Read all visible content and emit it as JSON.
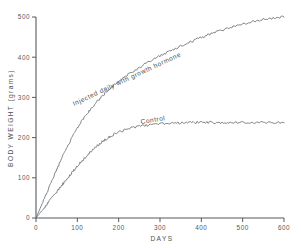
{
  "chart_data": {
    "type": "line",
    "title": "",
    "xlabel": "DAYS",
    "ylabel": "BODY WEIGHT (grams)",
    "xlim": [
      0,
      600
    ],
    "ylim": [
      0,
      500
    ],
    "xticks": [
      0,
      100,
      200,
      300,
      400,
      500,
      600
    ],
    "yticks": [
      0,
      100,
      200,
      300,
      400,
      500
    ],
    "xtick_labels": [
      "0",
      "100",
      "200",
      "300",
      "400",
      "500",
      "600"
    ],
    "ytick_labels": [
      "0",
      "100",
      "200",
      "300",
      "400",
      "500"
    ],
    "grid": false,
    "legend": "inline-annotations",
    "series": [
      {
        "name": "Injected daily with growth hormone",
        "label_text": "Injected daily with growth hormone",
        "color": "#6b7075",
        "x": [
          0,
          10,
          20,
          30,
          40,
          50,
          60,
          70,
          80,
          90,
          100,
          110,
          120,
          130,
          140,
          150,
          160,
          170,
          180,
          190,
          200,
          220,
          240,
          260,
          280,
          300,
          320,
          340,
          360,
          380,
          400,
          420,
          440,
          460,
          480,
          500,
          520,
          540,
          560,
          580,
          600
        ],
        "y": [
          0,
          24,
          48,
          72,
          96,
          120,
          143,
          165,
          186,
          205,
          223,
          240,
          255,
          268,
          281,
          292,
          303,
          313,
          322,
          331,
          340,
          355,
          368,
          381,
          392,
          403,
          413,
          423,
          432,
          441,
          449,
          457,
          464,
          471,
          477,
          483,
          488,
          492,
          496,
          498,
          500
        ]
      },
      {
        "name": "Control",
        "label_text": "Control",
        "color": "#6b7075",
        "x": [
          0,
          10,
          20,
          30,
          40,
          50,
          60,
          70,
          80,
          90,
          100,
          110,
          120,
          130,
          140,
          150,
          160,
          170,
          180,
          190,
          200,
          220,
          240,
          260,
          280,
          300,
          320,
          340,
          360,
          380,
          400,
          420,
          440,
          460,
          480,
          500,
          520,
          540,
          560,
          580,
          600
        ],
        "y": [
          0,
          13,
          26,
          39,
          52,
          65,
          78,
          91,
          104,
          117,
          129,
          141,
          152,
          162,
          172,
          181,
          189,
          196,
          203,
          209,
          214,
          221,
          226,
          229,
          232,
          234,
          235,
          236,
          237,
          238,
          237,
          238,
          237,
          238,
          237,
          238,
          237,
          237,
          237,
          237,
          237
        ]
      }
    ],
    "annotations": [
      {
        "name": "treated-curve-label",
        "text": "Injected daily with growth hormone",
        "rotation": -25
      },
      {
        "name": "control-curve-label",
        "text": "Control",
        "rotation": -9
      }
    ]
  }
}
